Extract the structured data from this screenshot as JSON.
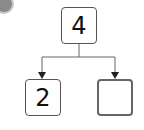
{
  "badge": {
    "label": ""
  },
  "diagram": {
    "type": "number-bond",
    "top": {
      "value": "4"
    },
    "left": {
      "value": "2"
    },
    "right": {
      "value": ""
    }
  },
  "colors": {
    "line": "#555555",
    "badge": "#8a8a8a"
  }
}
